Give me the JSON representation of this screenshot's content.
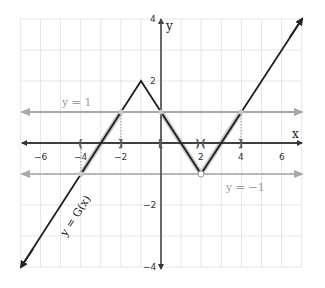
{
  "diagram": {
    "type": "function-graph",
    "axes": {
      "x_label": "x",
      "y_label": "y",
      "x_range": [
        -7,
        7
      ],
      "y_range": [
        -4,
        4
      ],
      "x_ticks": [
        {
          "value": -6,
          "label": "−6"
        },
        {
          "value": -4,
          "label": "−4"
        },
        {
          "value": -2,
          "label": "−2"
        },
        {
          "value": 2,
          "label": "2"
        },
        {
          "value": 4,
          "label": "4"
        },
        {
          "value": 6,
          "label": "6"
        }
      ],
      "y_ticks": [
        {
          "value": 4,
          "label": "4"
        },
        {
          "value": 2,
          "label": "2"
        },
        {
          "value": -2,
          "label": "−2"
        },
        {
          "value": -4,
          "label": "−4"
        }
      ],
      "grid": true
    },
    "curve": {
      "label": "y = G(x)",
      "points": [
        [
          -7,
          -4
        ],
        [
          -1,
          2
        ],
        [
          2,
          -1
        ],
        [
          7,
          4
        ]
      ],
      "color": "#222222"
    },
    "reference_lines": [
      {
        "label": "y = 1",
        "y": 1,
        "style": "solid",
        "color": "#a8a8a8"
      },
      {
        "label": "y = −1",
        "y": -1,
        "style": "dashed",
        "color": "#a8a8a8"
      }
    ],
    "intervals": [
      {
        "left": "(",
        "left_x": -4,
        "right": "]",
        "right_x": -2
      },
      {
        "left": "[",
        "left_x": 0,
        "right": ")",
        "right_x": 2
      },
      {
        "left": "(",
        "left_x": 2,
        "right": "]",
        "right_x": 4
      }
    ],
    "open_point": {
      "x": 2,
      "y": -1
    },
    "highlight_color": "#c8c8c8"
  }
}
